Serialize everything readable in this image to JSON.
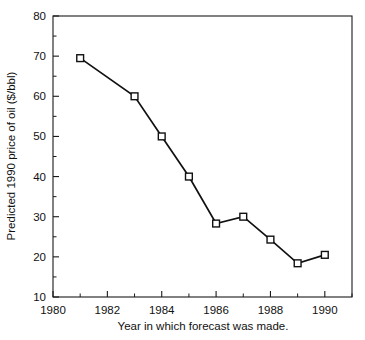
{
  "chart_data": {
    "type": "line",
    "title": "",
    "xlabel": "Year in which forecast was made.",
    "ylabel": "Predicted 1990 price of oil ($/bbl)",
    "xlim": [
      1980,
      1991
    ],
    "ylim": [
      10,
      80
    ],
    "grid": false,
    "legend": null,
    "marker": "open-square",
    "x_ticks_major": [
      1980,
      1982,
      1984,
      1986,
      1988,
      1990
    ],
    "x_tick_labels": [
      "1980",
      "1982",
      "1984",
      "1986",
      "1988",
      "1990"
    ],
    "x_ticks_minor": [
      1981,
      1983,
      1985,
      1987,
      1989,
      1991
    ],
    "y_ticks_major": [
      10,
      20,
      30,
      40,
      50,
      60,
      70,
      80
    ],
    "y_tick_labels": [
      "10",
      "20",
      "30",
      "40",
      "50",
      "60",
      "70",
      "80"
    ],
    "y_ticks_minor": [
      15,
      25,
      35,
      45,
      55,
      65,
      75
    ],
    "x": [
      1981,
      1983,
      1984,
      1985,
      1986,
      1987,
      1988,
      1989,
      1990
    ],
    "values": [
      69.5,
      60.0,
      50.0,
      40.0,
      28.3,
      30.0,
      24.3,
      18.4,
      20.5
    ],
    "series": [
      {
        "name": "Predicted 1990 price of oil",
        "x": [
          1981,
          1983,
          1984,
          1985,
          1986,
          1987,
          1988,
          1989,
          1990
        ],
        "values": [
          69.5,
          60.0,
          50.0,
          40.0,
          28.3,
          30.0,
          24.3,
          18.4,
          20.5
        ]
      }
    ],
    "colors": {
      "line": "#111111",
      "marker_fill": "#ffffff",
      "marker_stroke": "#111111",
      "axis": "#1a1a1a",
      "background": "#ffffff"
    }
  }
}
